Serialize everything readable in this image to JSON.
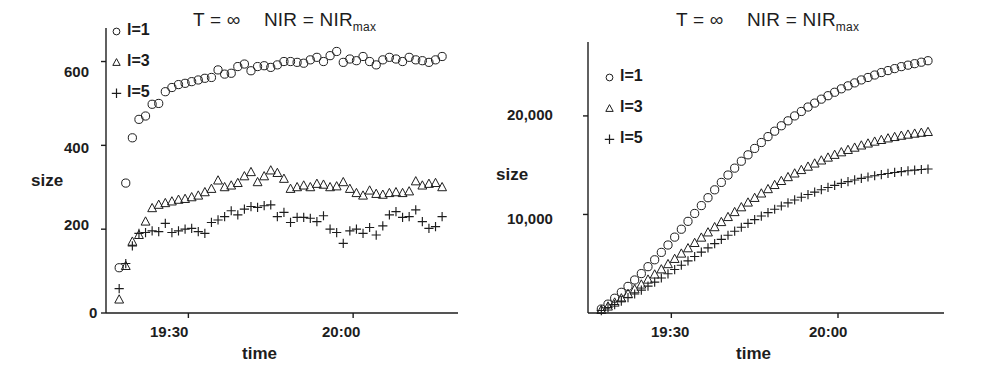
{
  "figure": {
    "background": "#ffffff",
    "ink_color": "#1d1d1d",
    "panel_count": 2
  },
  "panels": [
    {
      "id": "left",
      "title": "T = ∞   NIR = NIR",
      "title_main": "T = ∞",
      "title_second": "NIR = NIR",
      "title_sub": "max",
      "ylabel": "size",
      "xlabel": "time",
      "yticks": [
        "0",
        "200",
        "400",
        "600"
      ],
      "xticks": [
        "19:30",
        "20:00"
      ],
      "legend": [
        {
          "marker": "circle-marker",
          "label": "l=1"
        },
        {
          "marker": "triangle-marker",
          "label": "l=3"
        },
        {
          "marker": "plus-marker",
          "label": "l=5"
        }
      ]
    },
    {
      "id": "right",
      "title": "T = ∞   NIR = NIR",
      "title_main": "T = ∞",
      "title_second": "NIR = NIR",
      "title_sub": "max",
      "ylabel": "size",
      "xlabel": "time",
      "yticks": [
        "10,000",
        "20,000"
      ],
      "xticks": [
        "19:30",
        "20:00"
      ],
      "legend": [
        {
          "marker": "circle-marker",
          "label": "l=1"
        },
        {
          "marker": "triangle-marker",
          "label": "l=3"
        },
        {
          "marker": "plus-marker",
          "label": "l=5"
        }
      ]
    }
  ],
  "chart_data": [
    {
      "type": "scatter",
      "id": "left-panel-instantaneous-size",
      "title": "T = ∞   NIR = NIR_max",
      "xlabel": "time",
      "ylabel": "size",
      "xlim": [
        19.25,
        20.3
      ],
      "ylim": [
        0,
        680
      ],
      "grid": false,
      "legend_position": "top-left",
      "xtick_values": [
        19.5,
        20.0
      ],
      "xtick_labels": [
        "19:30",
        "20:00"
      ],
      "ytick_values": [
        0,
        200,
        400,
        600
      ],
      "ytick_labels": [
        "0",
        "200",
        "400",
        "600"
      ],
      "series": [
        {
          "name": "l=1",
          "marker": "circle",
          "x": [
            19.29,
            19.31,
            19.33,
            19.35,
            19.37,
            19.39,
            19.41,
            19.43,
            19.45,
            19.47,
            19.49,
            19.51,
            19.53,
            19.55,
            19.57,
            19.59,
            19.61,
            19.63,
            19.65,
            19.67,
            19.69,
            19.71,
            19.73,
            19.75,
            19.77,
            19.79,
            19.81,
            19.83,
            19.85,
            19.87,
            19.89,
            19.91,
            19.93,
            19.95,
            19.97,
            19.99,
            20.01,
            20.03,
            20.05,
            20.07,
            20.09,
            20.11,
            20.13,
            20.15,
            20.17,
            20.19,
            20.21,
            20.23,
            20.25,
            20.27
          ],
          "y": [
            108,
            310,
            418,
            462,
            470,
            498,
            500,
            528,
            538,
            545,
            548,
            552,
            556,
            560,
            562,
            580,
            570,
            572,
            588,
            594,
            578,
            588,
            590,
            586,
            592,
            600,
            600,
            598,
            596,
            604,
            610,
            600,
            614,
            624,
            598,
            606,
            602,
            612,
            600,
            592,
            604,
            610,
            606,
            600,
            610,
            604,
            602,
            598,
            604,
            612
          ]
        },
        {
          "name": "l=3",
          "marker": "triangle",
          "x": [
            19.29,
            19.31,
            19.33,
            19.35,
            19.37,
            19.39,
            19.41,
            19.43,
            19.45,
            19.47,
            19.49,
            19.51,
            19.53,
            19.55,
            19.57,
            19.59,
            19.61,
            19.63,
            19.65,
            19.67,
            19.69,
            19.71,
            19.73,
            19.75,
            19.77,
            19.79,
            19.81,
            19.83,
            19.85,
            19.87,
            19.89,
            19.91,
            19.93,
            19.95,
            19.97,
            19.99,
            20.01,
            20.03,
            20.05,
            20.07,
            20.09,
            20.11,
            20.13,
            20.15,
            20.17,
            20.19,
            20.21,
            20.23,
            20.25,
            20.27
          ],
          "y": [
            32,
            112,
            170,
            186,
            218,
            250,
            258,
            262,
            266,
            270,
            272,
            276,
            280,
            288,
            296,
            316,
            300,
            304,
            310,
            326,
            336,
            312,
            326,
            340,
            334,
            320,
            296,
            300,
            304,
            300,
            308,
            306,
            300,
            302,
            312,
            296,
            286,
            280,
            292,
            284,
            282,
            286,
            288,
            286,
            290,
            314,
            304,
            308,
            310,
            300
          ]
        },
        {
          "name": "l=5",
          "marker": "plus",
          "x": [
            19.29,
            19.31,
            19.33,
            19.35,
            19.37,
            19.39,
            19.41,
            19.43,
            19.45,
            19.47,
            19.49,
            19.51,
            19.53,
            19.55,
            19.57,
            19.59,
            19.61,
            19.63,
            19.65,
            19.67,
            19.69,
            19.71,
            19.73,
            19.75,
            19.77,
            19.79,
            19.81,
            19.83,
            19.85,
            19.87,
            19.89,
            19.91,
            19.93,
            19.95,
            19.97,
            19.99,
            20.01,
            20.03,
            20.05,
            20.07,
            20.09,
            20.11,
            20.13,
            20.15,
            20.17,
            20.19,
            20.21,
            20.23,
            20.25,
            20.27
          ],
          "y": [
            58,
            118,
            160,
            190,
            192,
            196,
            194,
            214,
            192,
            196,
            200,
            202,
            194,
            190,
            216,
            222,
            230,
            244,
            234,
            248,
            254,
            252,
            256,
            258,
            230,
            240,
            216,
            228,
            228,
            226,
            218,
            232,
            200,
            192,
            166,
            196,
            200,
            190,
            204,
            186,
            208,
            234,
            242,
            228,
            230,
            246,
            218,
            202,
            206,
            230
          ]
        }
      ]
    },
    {
      "type": "scatter",
      "id": "right-panel-cumulative-size",
      "title": "T = ∞   NIR = NIR_max",
      "xlabel": "time",
      "ylabel": "size",
      "xlim": [
        19.25,
        20.3
      ],
      "ylim": [
        0,
        27500
      ],
      "grid": false,
      "legend_position": "upper-left",
      "xtick_values": [
        19.5,
        20.0
      ],
      "xtick_labels": [
        "19:30",
        "20:00"
      ],
      "ytick_values": [
        10000,
        20000
      ],
      "ytick_labels": [
        "10,000",
        "20,000"
      ],
      "series": [
        {
          "name": "l=1",
          "marker": "circle",
          "x": [
            19.29,
            19.31,
            19.33,
            19.35,
            19.37,
            19.39,
            19.41,
            19.43,
            19.45,
            19.47,
            19.49,
            19.51,
            19.53,
            19.55,
            19.57,
            19.59,
            19.61,
            19.63,
            19.65,
            19.67,
            19.69,
            19.71,
            19.73,
            19.75,
            19.77,
            19.79,
            19.81,
            19.83,
            19.85,
            19.87,
            19.89,
            19.91,
            19.93,
            19.95,
            19.97,
            19.99,
            20.01,
            20.03,
            20.05,
            20.07,
            20.09,
            20.11,
            20.13,
            20.15,
            20.17,
            20.19,
            20.21,
            20.23,
            20.25,
            20.27
          ],
          "y": [
            400,
            900,
            1500,
            2100,
            2700,
            3350,
            4000,
            4700,
            5400,
            6150,
            6900,
            7700,
            8500,
            9300,
            10100,
            10900,
            11700,
            12500,
            13250,
            14000,
            14700,
            15400,
            16050,
            16700,
            17300,
            17900,
            18450,
            19000,
            19500,
            20000,
            20450,
            20900,
            21300,
            21700,
            22050,
            22400,
            22750,
            23050,
            23350,
            23650,
            23900,
            24150,
            24400,
            24600,
            24800,
            25000,
            25150,
            25300,
            25450,
            25600
          ]
        },
        {
          "name": "l=3",
          "marker": "triangle",
          "x": [
            19.29,
            19.31,
            19.33,
            19.35,
            19.37,
            19.39,
            19.41,
            19.43,
            19.45,
            19.47,
            19.49,
            19.51,
            19.53,
            19.55,
            19.57,
            19.59,
            19.61,
            19.63,
            19.65,
            19.67,
            19.69,
            19.71,
            19.73,
            19.75,
            19.77,
            19.79,
            19.81,
            19.83,
            19.85,
            19.87,
            19.89,
            19.91,
            19.93,
            19.95,
            19.97,
            19.99,
            20.01,
            20.03,
            20.05,
            20.07,
            20.09,
            20.11,
            20.13,
            20.15,
            20.17,
            20.19,
            20.21,
            20.23,
            20.25,
            20.27
          ],
          "y": [
            300,
            650,
            1050,
            1480,
            1930,
            2400,
            2880,
            3380,
            3900,
            4420,
            4950,
            5480,
            6020,
            6560,
            7100,
            7640,
            8170,
            8700,
            9220,
            9730,
            10230,
            10720,
            11200,
            11670,
            12120,
            12560,
            12980,
            13390,
            13780,
            14150,
            14500,
            14840,
            15160,
            15470,
            15760,
            16040,
            16300,
            16540,
            16770,
            16990,
            17190,
            17380,
            17550,
            17710,
            17850,
            17980,
            18090,
            18190,
            18280,
            18360
          ]
        },
        {
          "name": "l=5",
          "marker": "plus",
          "x": [
            19.29,
            19.31,
            19.33,
            19.35,
            19.37,
            19.39,
            19.41,
            19.43,
            19.45,
            19.47,
            19.49,
            19.51,
            19.53,
            19.55,
            19.57,
            19.59,
            19.61,
            19.63,
            19.65,
            19.67,
            19.69,
            19.71,
            19.73,
            19.75,
            19.77,
            19.79,
            19.81,
            19.83,
            19.85,
            19.87,
            19.89,
            19.91,
            19.93,
            19.95,
            19.97,
            19.99,
            20.01,
            20.03,
            20.05,
            20.07,
            20.09,
            20.11,
            20.13,
            20.15,
            20.17,
            20.19,
            20.21,
            20.23,
            20.25,
            20.27
          ],
          "y": [
            250,
            540,
            860,
            1200,
            1560,
            1930,
            2320,
            2720,
            3130,
            3550,
            3980,
            4410,
            4850,
            5290,
            5730,
            6170,
            6610,
            7040,
            7470,
            7890,
            8300,
            8700,
            9090,
            9470,
            9840,
            10190,
            10530,
            10860,
            11170,
            11470,
            11750,
            12020,
            12270,
            12510,
            12740,
            12950,
            13150,
            13330,
            13500,
            13660,
            13800,
            13930,
            14050,
            14160,
            14260,
            14350,
            14430,
            14500,
            14560,
            14610
          ]
        }
      ]
    }
  ]
}
